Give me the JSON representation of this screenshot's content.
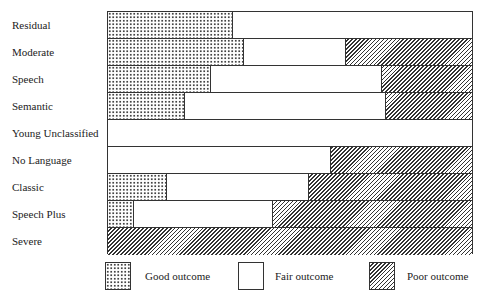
{
  "chart_data": {
    "type": "bar",
    "orientation": "horizontal",
    "stacked": true,
    "normalized_percent": true,
    "title": "",
    "xlabel": "",
    "ylabel": "",
    "xlim": [
      0,
      100
    ],
    "grid": false,
    "legend_position": "bottom",
    "categories": [
      "Residual",
      "Moderate",
      "Speech",
      "Semantic",
      "Young Unclassified",
      "No Language",
      "Classic",
      "Speech Plus",
      "Severe"
    ],
    "series": [
      {
        "name": "Good outcome",
        "pattern": "dotted",
        "values": [
          34,
          37,
          28,
          21,
          0,
          0,
          16,
          7,
          0
        ]
      },
      {
        "name": "Fair outcome",
        "pattern": "blank",
        "values": [
          66,
          28,
          47,
          55,
          100,
          61,
          39,
          38,
          0
        ]
      },
      {
        "name": "Poor outcome",
        "pattern": "hatched",
        "values": [
          0,
          35,
          25,
          24,
          0,
          39,
          45,
          55,
          100
        ]
      }
    ]
  },
  "legend": {
    "good": "Good outcome",
    "fair": "Fair outcome",
    "poor": "Poor outcome"
  }
}
